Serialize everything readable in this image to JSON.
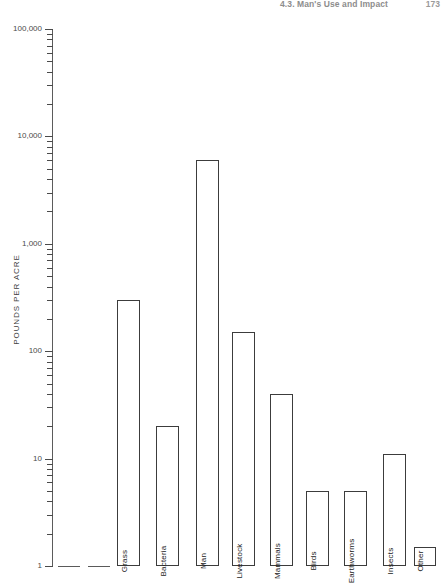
{
  "running_head": {
    "text": "4.3. Man's Use and Impact",
    "page": "173"
  },
  "chart_data": {
    "type": "bar",
    "title": "",
    "xlabel": "",
    "ylabel": "POUNDS PER ACRE",
    "yscale": "log",
    "ylim": [
      1,
      100000
    ],
    "ytick_labels": [
      "100,000",
      "10,000",
      "1,000",
      "100",
      "10",
      "1"
    ],
    "ytick_values": [
      100000,
      10000,
      1000,
      100,
      10,
      1
    ],
    "grid": false,
    "legend": null,
    "categories": [
      "",
      "",
      "Grass",
      "Bacteria",
      "Man",
      "Livestock",
      "Mammals",
      "Birds",
      "Earthworms",
      "Insects",
      "Other"
    ],
    "values": [
      1,
      1,
      300,
      20,
      6000,
      150,
      40,
      5,
      5,
      11,
      1.5
    ],
    "bars": [
      {
        "label": "",
        "value": 1,
        "x": 58,
        "width": 22,
        "flat": true
      },
      {
        "label": "",
        "value": 1,
        "x": 88,
        "width": 22,
        "flat": true
      },
      {
        "label": "Grass",
        "value": 300,
        "x": 117,
        "width": 23,
        "flat": false
      },
      {
        "label": "Bacteria",
        "value": 20,
        "x": 156,
        "width": 23,
        "flat": false
      },
      {
        "label": "Man",
        "value": 6000,
        "x": 196,
        "width": 23,
        "flat": false
      },
      {
        "label": "Livestock",
        "value": 150,
        "x": 232,
        "width": 23,
        "flat": false
      },
      {
        "label": "Mammals",
        "value": 40,
        "x": 270,
        "width": 23,
        "flat": false
      },
      {
        "label": "Birds",
        "value": 5,
        "x": 306,
        "width": 23,
        "flat": false
      },
      {
        "label": "Earthworms",
        "value": 5,
        "x": 344,
        "width": 23,
        "flat": false
      },
      {
        "label": "Insects",
        "value": 11,
        "x": 383,
        "width": 23,
        "flat": false
      },
      {
        "label": "Other",
        "value": 1.5,
        "x": 414,
        "width": 22,
        "flat": false
      }
    ]
  },
  "colors": {
    "axis": "#4a4a4a",
    "bar_stroke": "#3c3c3c",
    "bar_fill": "#ffffff",
    "running_head": "#8d8d8d"
  }
}
